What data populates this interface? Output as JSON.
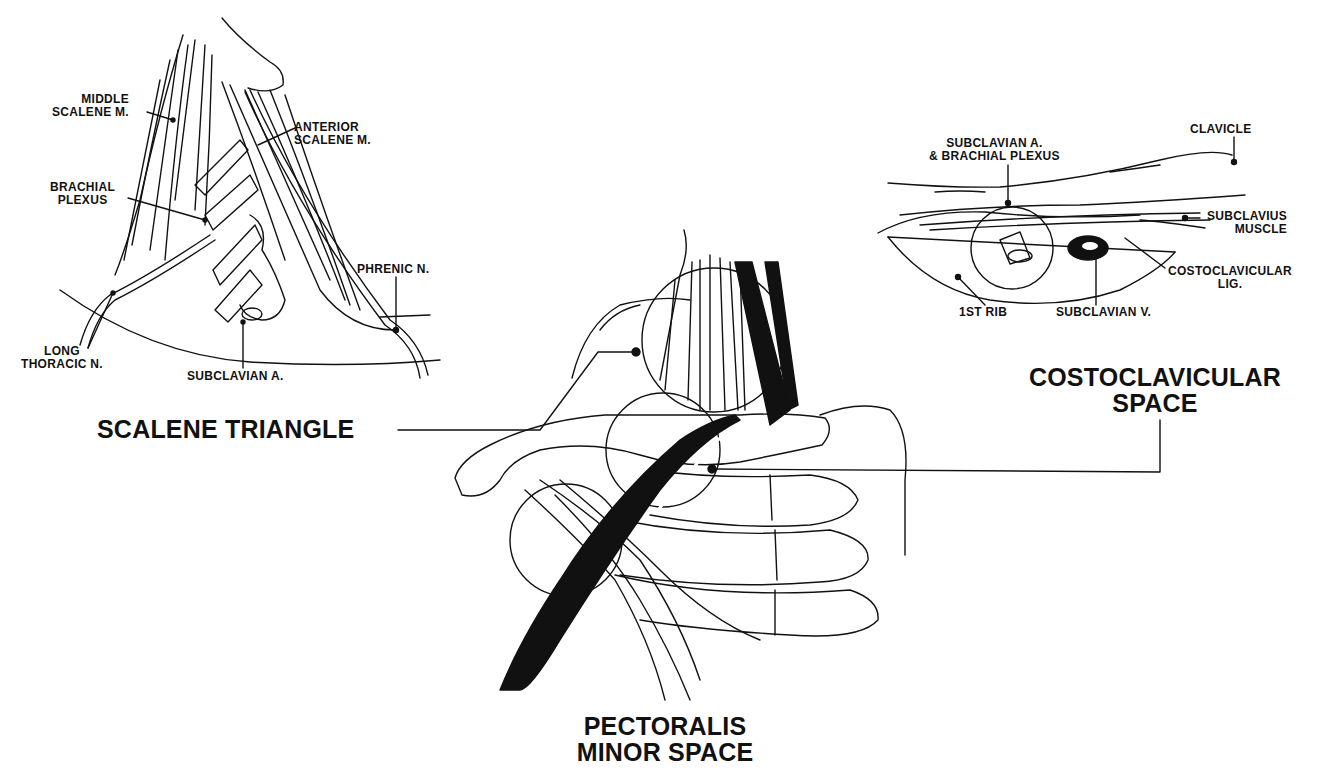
{
  "figure": {
    "regions": [
      {
        "id": "scalene",
        "label": "SCALENE TRIANGLE"
      },
      {
        "id": "costoclavicular",
        "label_line1": "COSTOCLAVICULAR",
        "label_line2": "SPACE"
      },
      {
        "id": "pectoralis",
        "label_line1": "PECTORALIS",
        "label_line2": "MINOR SPACE"
      }
    ]
  },
  "inset_scalene": {
    "labels": {
      "middle_scalene_1": "MIDDLE",
      "middle_scalene_2": "SCALENE M.",
      "anterior_scalene_1": "ANTERIOR",
      "anterior_scalene_2": "SCALENE M.",
      "brachial_plexus_1": "BRACHIAL",
      "brachial_plexus_2": "PLEXUS",
      "phrenic": "PHRENIC N.",
      "long_thoracic_1": "LONG",
      "long_thoracic_2": "THORACIC N.",
      "subclavian_a": "SUBCLAVIAN A."
    }
  },
  "inset_costoclavicular": {
    "labels": {
      "subclavian_bp_1": "SUBCLAVIAN A.",
      "subclavian_bp_2": "& BRACHIAL PLEXUS",
      "clavicle": "CLAVICLE",
      "subclavius_1": "SUBCLAVIUS",
      "subclavius_2": "MUSCLE",
      "costoclavicular_lig_1": "COSTOCLAVICULAR",
      "costoclavicular_lig_2": "LIG.",
      "first_rib": "1ST RIB",
      "subclavian_v": "SUBCLAVIAN V."
    }
  }
}
